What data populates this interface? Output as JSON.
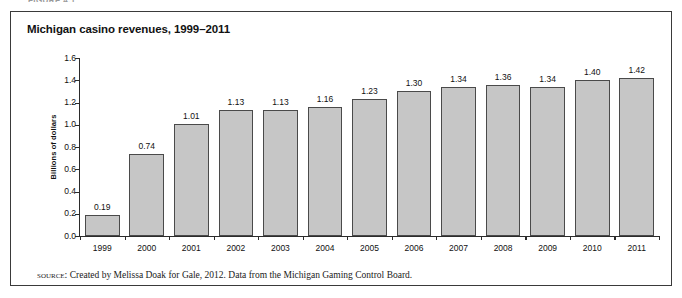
{
  "figure": {
    "caption_cropped": "FIGURE 4.1",
    "title": "Michigan casino revenues, 1999–2011",
    "source_label": "Source:",
    "source_text": " Created by Melissa Doak for Gale, 2012. Data from the Michigan Gaming Control Board."
  },
  "style": {
    "bar_fill": "#c6c6c6",
    "bar_border": "#4a4a4a",
    "axis_color": "#2b2b2b",
    "frame_border": "#3a3a3a",
    "background": "#ffffff"
  },
  "chart_data": {
    "type": "bar",
    "title": "Michigan casino revenues, 1999–2011",
    "xlabel": "",
    "ylabel": "Billions of dollars",
    "ylim": [
      0.0,
      1.6
    ],
    "ytick_labels": [
      "1.6",
      "1.4",
      "1.2",
      "1.0",
      "0.8",
      "0.6",
      "0.4",
      "0.2",
      "0.0"
    ],
    "ytick_values": [
      1.6,
      1.4,
      1.2,
      1.0,
      0.8,
      0.6,
      0.4,
      0.2,
      0.0
    ],
    "grid": false,
    "legend": null,
    "categories": [
      "1999",
      "2000",
      "2001",
      "2002",
      "2003",
      "2004",
      "2005",
      "2006",
      "2007",
      "2008",
      "2009",
      "2010",
      "2011"
    ],
    "values": [
      0.19,
      0.74,
      1.01,
      1.13,
      1.13,
      1.16,
      1.23,
      1.3,
      1.34,
      1.36,
      1.34,
      1.4,
      1.42
    ],
    "value_labels": [
      "0.19",
      "0.74",
      "1.01",
      "1.13",
      "1.13",
      "1.16",
      "1.23",
      "1.30",
      "1.34",
      "1.36",
      "1.34",
      "1.40",
      "1.42"
    ]
  }
}
